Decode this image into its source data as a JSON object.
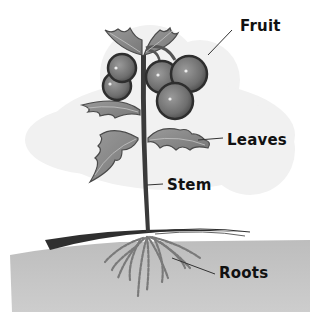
{
  "diagram": {
    "labels": {
      "fruit": "Fruit",
      "leaves": "Leaves",
      "stem": "Stem",
      "roots": "Roots"
    },
    "colors": {
      "background": "#ffffff",
      "backdrop_cloud": "#f0f0f0",
      "soil": "#c8c8c8",
      "ground_line": "#333333",
      "stem": "#3a3a3a",
      "leaf_fill": "#8a8a8a",
      "leaf_edge": "#4a4a4a",
      "fruit_fill": "#777777",
      "fruit_edge": "#2e2e2e",
      "root": "#7a7a7a",
      "leader_line": "#333333",
      "label_text": "#111111"
    }
  }
}
